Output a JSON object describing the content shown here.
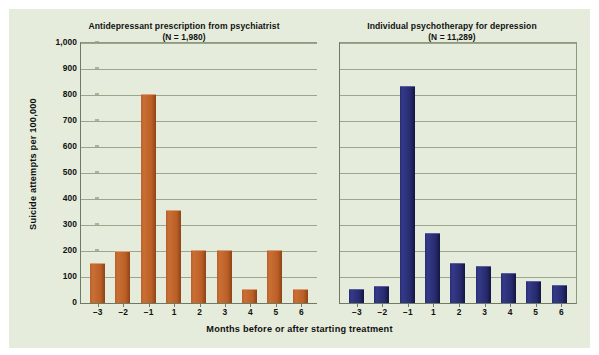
{
  "chart_data": {
    "type": "bar",
    "title": "",
    "xlabel": "Months before or after starting treatment",
    "ylabel": "Suicide attempts per 100,000",
    "categories": [
      "−3",
      "−2",
      "−1",
      "1",
      "2",
      "3",
      "4",
      "5",
      "6"
    ],
    "ylim": [
      0,
      1000
    ],
    "yticks": [
      "0",
      "100",
      "200",
      "300",
      "400",
      "500",
      "600",
      "700",
      "800",
      "900",
      "1,000"
    ],
    "ytick_values": [
      0,
      100,
      200,
      300,
      400,
      500,
      600,
      700,
      800,
      900,
      1000
    ],
    "grid": true,
    "legend": "none",
    "panels": [
      {
        "title": "Antidepressant prescription from psychiatrist",
        "subtitle": "(N = 1,980)",
        "n_label": "(N = 1,980)",
        "color": "#bb5f26",
        "series_name": "Antidepressant prescription from psychiatrist",
        "values": [
          150,
          195,
          800,
          355,
          200,
          200,
          50,
          200,
          50
        ]
      },
      {
        "title": "Individual psychotherapy for depression",
        "subtitle": "(N = 11,289)",
        "n_label": "(N = 11,289)",
        "color": "#272a6e",
        "series_name": "Individual psychotherapy for depression",
        "values": [
          50,
          60,
          830,
          265,
          150,
          140,
          110,
          80,
          65
        ]
      }
    ]
  },
  "figure": {
    "background_color": "#e5ecdb",
    "axis_color": "#6f7a62",
    "grid_color": "#9aa78c",
    "page_background": "#ffffff"
  }
}
